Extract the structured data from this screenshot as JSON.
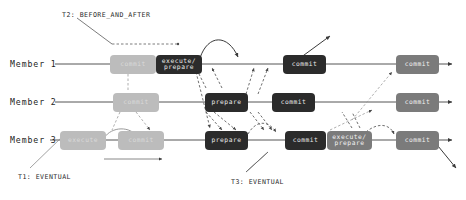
{
  "diagram": {
    "background": "#ffffff",
    "colors": {
      "dark_node": "#2b2b2b",
      "mid_node": "#7b7b7b",
      "light_node": "#bcbcbc",
      "lane_line": "#555555",
      "dashed_edge": "#4a4a4a",
      "text": "#1c1c1c"
    },
    "lanes": [
      {
        "id": "member-1",
        "label": "Member 1",
        "y": 64
      },
      {
        "id": "member-2",
        "label": "Member 2",
        "y": 102
      },
      {
        "id": "member-3",
        "label": "Member 3",
        "y": 140
      }
    ],
    "nodes": [
      {
        "id": "m1-commit-1",
        "lane": 0,
        "label": "commit",
        "shade": "light",
        "x": 110,
        "w": 46,
        "h": 19
      },
      {
        "id": "m1-execprep",
        "lane": 0,
        "label": "execute/\nprepare",
        "shade": "dark",
        "x": 156,
        "w": 46,
        "h": 19
      },
      {
        "id": "m1-commit-2",
        "lane": 0,
        "label": "commit",
        "shade": "dark",
        "x": 283,
        "w": 43,
        "h": 19
      },
      {
        "id": "m1-commit-3",
        "lane": 0,
        "label": "commit",
        "shade": "mid",
        "x": 396,
        "w": 43,
        "h": 19
      },
      {
        "id": "m2-commit-1",
        "lane": 1,
        "label": "commit",
        "shade": "light",
        "x": 113,
        "w": 46,
        "h": 19
      },
      {
        "id": "m2-prepare",
        "lane": 1,
        "label": "prepare",
        "shade": "dark",
        "x": 205,
        "w": 43,
        "h": 19
      },
      {
        "id": "m2-commit-2",
        "lane": 1,
        "label": "commit",
        "shade": "dark",
        "x": 272,
        "w": 43,
        "h": 19
      },
      {
        "id": "m2-commit-3",
        "lane": 1,
        "label": "commit",
        "shade": "mid",
        "x": 396,
        "w": 43,
        "h": 19
      },
      {
        "id": "m3-execute",
        "lane": 2,
        "label": "execute",
        "shade": "light",
        "x": 60,
        "w": 46,
        "h": 19
      },
      {
        "id": "m3-commit-1",
        "lane": 2,
        "label": "commit",
        "shade": "light",
        "x": 118,
        "w": 46,
        "h": 19
      },
      {
        "id": "m3-prepare",
        "lane": 2,
        "label": "prepare",
        "shade": "dark",
        "x": 205,
        "w": 43,
        "h": 19
      },
      {
        "id": "m3-commit-2",
        "lane": 2,
        "label": "commit",
        "shade": "dark",
        "x": 285,
        "w": 41,
        "h": 19
      },
      {
        "id": "m3-execprep",
        "lane": 2,
        "label": "execute/\nprepare",
        "shade": "mid",
        "x": 327,
        "w": 45,
        "h": 19
      },
      {
        "id": "m3-commit-3",
        "lane": 2,
        "label": "commit",
        "shade": "mid",
        "x": 396,
        "w": 43,
        "h": 19
      }
    ],
    "annotations": [
      {
        "id": "t2-label",
        "text": "T2: BEFORE_AND_AFTER",
        "x": 62,
        "y": 11
      },
      {
        "id": "t1-label",
        "text": "T1: EVENTUAL",
        "x": 18,
        "y": 173
      },
      {
        "id": "t3-label",
        "text": "T3: EVENTUAL",
        "x": 231,
        "y": 178
      }
    ]
  }
}
